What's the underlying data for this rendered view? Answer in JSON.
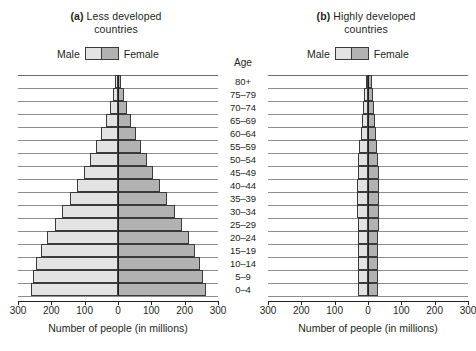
{
  "chart_data": {
    "type": "bar",
    "xlabel": "Number of people (in millions)",
    "ylabel": "Age",
    "xlim": [
      -300,
      300
    ],
    "xticks": [
      300,
      200,
      100,
      0,
      100,
      200,
      300
    ],
    "grid": true,
    "legend": [
      "Male",
      "Female"
    ],
    "categories": [
      "80+",
      "75–79",
      "70–74",
      "65–69",
      "60–64",
      "55–59",
      "50–54",
      "45–49",
      "40–44",
      "35–39",
      "30–34",
      "25–29",
      "20–24",
      "15–19",
      "10–14",
      "5–9",
      "0–4"
    ],
    "panels": [
      {
        "key": "a",
        "tag": "(a)",
        "title_line1": "Less developed",
        "title_line2": "countries",
        "series": [
          {
            "name": "Male",
            "values": [
              8,
              14,
              23,
              35,
              50,
              65,
              83,
              103,
              124,
              145,
              168,
              190,
              212,
              230,
              245,
              255,
              262
            ]
          },
          {
            "name": "Female",
            "values": [
              10,
              17,
              27,
              39,
              54,
              69,
              87,
              106,
              127,
              148,
              170,
              192,
              213,
              231,
              246,
              256,
              263
            ]
          }
        ]
      },
      {
        "key": "b",
        "tag": "(b)",
        "title_line1": "Highly developed",
        "title_line2": "countries",
        "series": [
          {
            "name": "Male",
            "values": [
              7,
              11,
              14,
              18,
              22,
              26,
              29,
              31,
              33,
              33,
              32,
              31,
              31,
              31,
              31,
              30,
              30
            ]
          },
          {
            "name": "Female",
            "values": [
              12,
              16,
              19,
              22,
              25,
              28,
              30,
              32,
              34,
              34,
              33,
              32,
              31,
              31,
              31,
              30,
              30
            ]
          }
        ]
      }
    ]
  },
  "panel_a": {
    "tag": "(a)",
    "title_line1": "Less developed",
    "title_line2": "countries",
    "legend_male": "Male",
    "legend_female": "Female",
    "xtitle": "Number of people (in millions)"
  },
  "panel_b": {
    "tag": "(b)",
    "title_line1": "Highly developed",
    "title_line2": "countries",
    "legend_male": "Male",
    "legend_female": "Female",
    "xtitle": "Number of people (in millions)"
  },
  "age_axis": {
    "header": "Age"
  },
  "colors": {
    "male": "#e3e3e3",
    "female": "#b2b2b2",
    "outline": "#3b3b3b",
    "gridline": "#8d8d8d",
    "text": "#231f20"
  }
}
